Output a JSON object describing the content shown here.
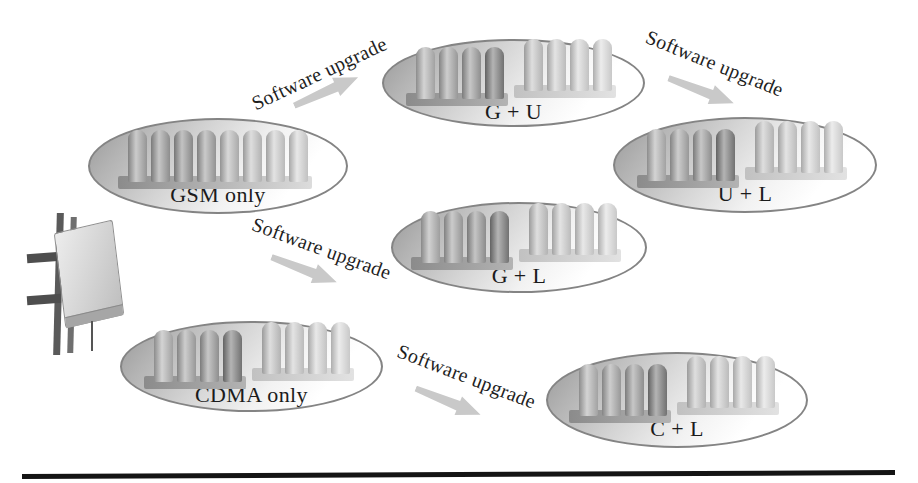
{
  "figure": {
    "nodes": [
      {
        "id": "gsm-only",
        "label": "GSM only",
        "groups": [
          {
            "tone": "gradient",
            "shades": [
              "#a6a6a6",
              "#9d9d9d",
              "#979797",
              "#a3a3a3",
              "#bcbcbc",
              "#c6c6c6",
              "#cfcfcf",
              "#d7d7d7"
            ]
          }
        ]
      },
      {
        "id": "g-plus-u",
        "label": "G + U",
        "groups": [
          {
            "tone": "dark",
            "shades": [
              "#b4b4b4",
              "#a9a9a9",
              "#9e9e9e",
              "#7e7e7e"
            ]
          },
          {
            "tone": "light",
            "shades": [
              "#c7c7c7",
              "#d0d0d0",
              "#d8d8d8",
              "#dfdfdf"
            ]
          }
        ]
      },
      {
        "id": "u-plus-l",
        "label": "U + L",
        "groups": [
          {
            "tone": "dark",
            "shades": [
              "#b4b4b4",
              "#a9a9a9",
              "#9e9e9e",
              "#7e7e7e"
            ]
          },
          {
            "tone": "light",
            "shades": [
              "#c7c7c7",
              "#d0d0d0",
              "#d8d8d8",
              "#dfdfdf"
            ]
          }
        ]
      },
      {
        "id": "g-plus-l",
        "label": "G + L",
        "groups": [
          {
            "tone": "dark",
            "shades": [
              "#b0b0b0",
              "#a6a6a6",
              "#9b9b9b",
              "#7e7e7e"
            ]
          },
          {
            "tone": "light",
            "shades": [
              "#c7c7c7",
              "#d0d0d0",
              "#d8d8d8",
              "#dfdfdf"
            ]
          }
        ]
      },
      {
        "id": "cdma-only",
        "label": "CDMA only",
        "groups": [
          {
            "tone": "dark",
            "shades": [
              "#b4b4b4",
              "#a9a9a9",
              "#9e9e9e",
              "#7e7e7e"
            ]
          },
          {
            "tone": "light",
            "shades": [
              "#c7c7c7",
              "#d0d0d0",
              "#d8d8d8",
              "#dfdfdf"
            ]
          }
        ]
      },
      {
        "id": "c-plus-l",
        "label": "C + L",
        "groups": [
          {
            "tone": "dark",
            "shades": [
              "#b4b4b4",
              "#a9a9a9",
              "#9e9e9e",
              "#7e7e7e"
            ]
          },
          {
            "tone": "light",
            "shades": [
              "#c7c7c7",
              "#d0d0d0",
              "#d8d8d8",
              "#dfdfdf"
            ]
          }
        ]
      }
    ],
    "arrows": [
      {
        "label": "Software upgrade",
        "from": "gsm-only",
        "to": "g-plus-u",
        "direction": "up-right"
      },
      {
        "label": "Software upgrade",
        "from": "g-plus-u",
        "to": "u-plus-l",
        "direction": "down-right"
      },
      {
        "label": "Software upgrade",
        "from": "gsm-only",
        "to": "g-plus-l",
        "direction": "down-right"
      },
      {
        "label": "Software upgrade",
        "from": "cdma-only",
        "to": "c-plus-l",
        "direction": "down-right"
      }
    ],
    "icons": {
      "base_station": "base-station-cabinet-on-mast"
    },
    "colors": {
      "arrow": "#c9c9c9",
      "ellipse_border": "#848484",
      "ellipse_shade": "#989898",
      "bar_dark": "#7e7e7e",
      "bar_light": "#dfdfdf",
      "text": "#1b1b1b",
      "bottom_rule": "#141414",
      "background": "#ffffff"
    }
  }
}
